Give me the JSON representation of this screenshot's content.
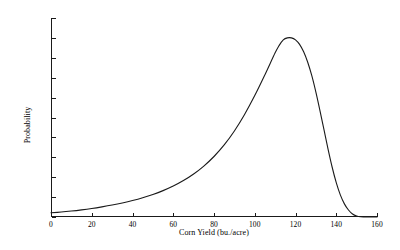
{
  "chart_data": {
    "type": "line",
    "title": "",
    "xlabel": "Corn Yield (bu./acre)",
    "ylabel": "Probability",
    "xlim": [
      0,
      160
    ],
    "ylim": [
      0.0,
      0.02
    ],
    "grid": false,
    "legend": null,
    "xticks": [
      0,
      20,
      40,
      60,
      80,
      100,
      120,
      140,
      160
    ],
    "xtick_labels": [
      "0",
      "20",
      "40",
      "60",
      "80",
      "100",
      "120",
      "140",
      "160"
    ],
    "yticks": [
      0.0,
      0.002,
      0.004,
      0.006,
      0.008,
      0.01,
      0.012,
      0.014,
      0.016,
      0.018,
      0.02
    ],
    "ytick_labels": [
      "0.000",
      "0.002",
      "0.004",
      "0.006",
      "0.008",
      "0.010",
      "0.012",
      "0.014",
      "0.016",
      "0.018",
      "0.020"
    ],
    "series": [
      {
        "name": "Corn yield probability density",
        "color": "#1a1a1a",
        "line_width": 1.1,
        "x": [
          0,
          5,
          10,
          15,
          20,
          25,
          30,
          35,
          40,
          45,
          50,
          55,
          60,
          65,
          70,
          75,
          80,
          85,
          90,
          95,
          100,
          105,
          110,
          112,
          114,
          116,
          118,
          120,
          122,
          124,
          126,
          128,
          130,
          132,
          134,
          136,
          138,
          140,
          142,
          144,
          146,
          148,
          150,
          152,
          155,
          160
        ],
        "y": [
          0.00042,
          0.0005,
          0.0006,
          0.00072,
          0.00086,
          0.00102,
          0.0012,
          0.00141,
          0.00165,
          0.00193,
          0.00226,
          0.00265,
          0.00311,
          0.00366,
          0.00432,
          0.00512,
          0.00608,
          0.00724,
          0.00864,
          0.0103,
          0.0122,
          0.0143,
          0.0165,
          0.01725,
          0.0178,
          0.018,
          0.018,
          0.0178,
          0.01735,
          0.0166,
          0.01555,
          0.0142,
          0.01255,
          0.0107,
          0.00875,
          0.0068,
          0.005,
          0.00345,
          0.00222,
          0.00132,
          0.0007,
          0.0003,
          0.0001,
          3e-05,
          0.0,
          0.0
        ]
      }
    ],
    "peak": {
      "x": 119,
      "y": 0.018
    },
    "axes_style": {
      "spines": [
        "left",
        "bottom"
      ],
      "tick_direction": "in",
      "axis_color": "#1a1a1a"
    },
    "background_color": "#ffffff"
  }
}
